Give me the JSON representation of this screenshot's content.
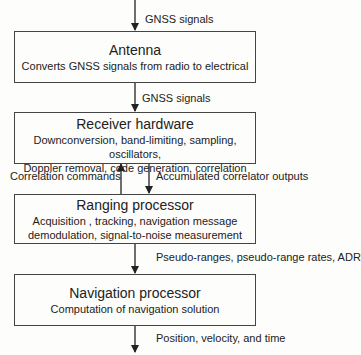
{
  "boxes": [
    {
      "title": "Antenna",
      "desc": [
        "Converts GNSS signals from radio to electrical"
      ]
    },
    {
      "title": "Receiver hardware",
      "desc": [
        "Downconversion, band-limiting, sampling, oscillators,",
        "Doppler removal, code generation, correlation"
      ]
    },
    {
      "title": "Ranging processor",
      "desc": [
        "Acquisition , tracking, navigation message",
        "demodulation, signal-to-noise measurement"
      ]
    },
    {
      "title": "Navigation processor",
      "desc": [
        "Computation of navigation solution"
      ]
    }
  ],
  "arrows": {
    "input": "GNSS signals",
    "antenna_to_receiver": "GNSS signals",
    "ranging_to_receiver": "Correlation commands",
    "receiver_to_ranging": "Accumulated correlator outputs",
    "ranging_to_navigation": "Pseudo-ranges, pseudo-range rates, ADR",
    "output": "Position, velocity, and time"
  }
}
